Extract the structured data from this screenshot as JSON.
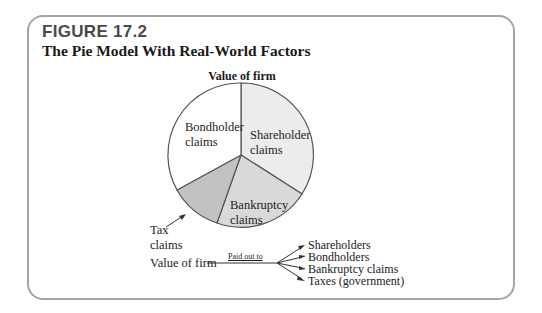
{
  "figure": {
    "label": "FIGURE 17.2",
    "title": "The Pie Model With Real-World Factors"
  },
  "pie": {
    "title": "Value of firm",
    "slices": [
      {
        "name": "Shareholder claims",
        "line1": "Shareholder",
        "line2": "claims",
        "color": "#ececec"
      },
      {
        "name": "Bankruptcy claims",
        "line1": "Bankruptcy",
        "line2": "claims",
        "color": "#d9d9d9"
      },
      {
        "name": "Tax claims",
        "line1": "Tax",
        "line2": "claims",
        "color": "#c4c4c4"
      },
      {
        "name": "Bondholder claims",
        "line1": "Bondholder",
        "line2": "claims",
        "color": "#ffffff"
      }
    ]
  },
  "flow": {
    "source": "Value of firm",
    "edge_label": "Paid out to",
    "targets": [
      "Shareholders",
      "Bondholders",
      "Bankruptcy claims",
      "Taxes (government)"
    ]
  },
  "colors": {
    "frame": "#a6a6a6",
    "stroke": "#555555"
  }
}
